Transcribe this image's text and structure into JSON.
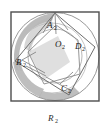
{
  "figure": {
    "caption": {
      "base": "R",
      "subscript": "2"
    },
    "frame": {
      "shape_name": "square",
      "stroke_color": "#4d4d4d"
    },
    "outer_circle": {
      "label": "circumscribed-circle",
      "stroke_color": "#9a9a9a"
    },
    "inner_circle": {
      "label": "inscribed-circle",
      "stroke_color": "#b0b0b0"
    },
    "shading_color": "#b7b7b7",
    "quadrilateral": {
      "stroke_color": "#6e6e6e",
      "vertices": [
        {
          "base": "A",
          "subscript": "2"
        },
        {
          "base": "B",
          "subscript": "2"
        },
        {
          "base": "C",
          "subscript": "2"
        },
        {
          "base": "D",
          "subscript": "2"
        }
      ],
      "center": {
        "base": "O",
        "subscript": "2"
      }
    },
    "inner_polygon": {
      "label": "inner-rotated-polygon",
      "stroke_color": "#8a8a8a"
    }
  }
}
